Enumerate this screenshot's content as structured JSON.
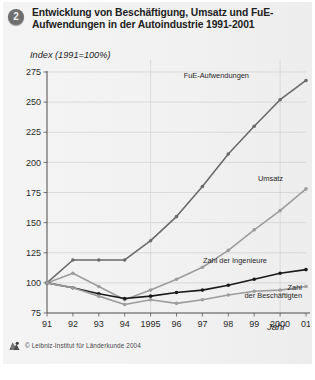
{
  "figure": {
    "number": "2",
    "title": "Entwicklung von Beschäftigung, Umsatz und FuE-Aufwendungen in der Autoindustrie 1991-2001",
    "credit": "© Leibniz-Institut für Länderkunde 2004",
    "logo_icon": "institute-logo-icon",
    "badge_icon": "figure-number-badge"
  },
  "chart_data": {
    "type": "line",
    "title": "Entwicklung von Beschäftigung, Umsatz und FuE-Aufwendungen in der Autoindustrie 1991-2001",
    "subtitle": "",
    "xlabel": "Jahr",
    "ylabel": "Index (1991=100%)",
    "x": [
      1991,
      1992,
      1993,
      1994,
      1995,
      1996,
      1997,
      1998,
      1999,
      2000,
      2001
    ],
    "xtick_labels": [
      "91",
      "92",
      "93",
      "94",
      "1995",
      "96",
      "97",
      "98",
      "99",
      "2000",
      "01"
    ],
    "ytick_labels": [
      "275",
      "250",
      "225",
      "200",
      "175",
      "150",
      "125",
      "100",
      "75"
    ],
    "yticks": [
      275,
      250,
      225,
      200,
      175,
      150,
      125,
      100,
      75
    ],
    "ylim": [
      75,
      275
    ],
    "xlim": [
      1991,
      2001
    ],
    "grid": true,
    "grid_orientation": "both",
    "legend_position": "inline-annotations",
    "series": [
      {
        "name": "FuE-Aufwendungen",
        "color": "#6b6b6b",
        "label_x": 1998.2,
        "label_y": 272,
        "values": [
          100,
          119,
          119,
          119,
          135,
          155,
          180,
          207,
          230,
          252,
          268
        ]
      },
      {
        "name": "Umsatz",
        "color": "#9d9d9d",
        "label_x": 1999.4,
        "label_y": 186,
        "values": [
          100,
          108,
          97,
          86,
          94,
          103,
          113,
          127,
          144,
          160,
          178
        ]
      },
      {
        "name": "Zahl der Ingenieure",
        "color": "#1a1a1a",
        "label_x": 1997.2,
        "label_y": 118,
        "values": [
          100,
          96,
          91,
          87,
          89,
          92,
          94,
          98,
          103,
          108,
          111
        ]
      },
      {
        "name": "Zahl der Beschäftigten",
        "color": "#9d9d9d",
        "label_x": 1999.3,
        "label_y": 92,
        "values": [
          100,
          96,
          89,
          82,
          86,
          83,
          86,
          90,
          93,
          94,
          97
        ]
      }
    ],
    "annotations": [
      {
        "text": "FuE-Aufwendungen"
      },
      {
        "text": "Umsatz"
      },
      {
        "text": "Zahl der Ingenieure"
      },
      {
        "text": "Zahl",
        "text2": "der Beschäftigten"
      }
    ]
  }
}
